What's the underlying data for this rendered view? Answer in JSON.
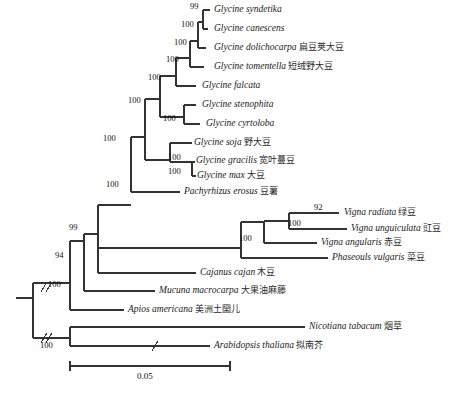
{
  "figure": {
    "kind": "phylogenetic-tree",
    "background_color": "#ffffff",
    "line_color": "#333333",
    "scale_bar": {
      "label": "0.05",
      "x_start": 70,
      "x_end": 230,
      "y": 366
    }
  },
  "taxa": [
    {
      "id": "glycine_syndetika",
      "latin": "Glycine syndetika",
      "chinese": "",
      "y": 10,
      "branch_x": 210,
      "label_x": 214
    },
    {
      "id": "glycine_canescens",
      "latin": "Glycine canescens",
      "chinese": "",
      "y": 29,
      "branch_x": 208,
      "label_x": 214
    },
    {
      "id": "glycine_dolichocarpa",
      "latin": "Glycine dolichocarpa",
      "chinese": "扁豆荚大豆",
      "y": 48,
      "branch_x": 206,
      "label_x": 214
    },
    {
      "id": "glycine_tomentella",
      "latin": "Glycine tomentella",
      "chinese": "短绒野大豆",
      "y": 67,
      "branch_x": 204,
      "label_x": 214
    },
    {
      "id": "glycine_falcata",
      "latin": "Glycine falcata",
      "chinese": "",
      "y": 86,
      "branch_x": 196,
      "label_x": 202
    },
    {
      "id": "glycine_stenophita",
      "latin": "Glycine stenophita",
      "chinese": "",
      "y": 105,
      "branch_x": 196,
      "label_x": 202
    },
    {
      "id": "glycine_cyrtoloba",
      "latin": "Glycine cyrtoloba",
      "chinese": "",
      "y": 124,
      "branch_x": 200,
      "label_x": 206
    },
    {
      "id": "glycine_soja",
      "latin": "Glycine soja",
      "chinese": "野大豆",
      "y": 143,
      "branch_x": 192,
      "label_x": 194
    },
    {
      "id": "glycine_gracilis",
      "latin": "Glycine gracilis",
      "chinese": "宽叶蔓豆",
      "y": 162,
      "branch_x": 195,
      "label_x": 196
    },
    {
      "id": "glycine_max",
      "latin": "Glycine max",
      "chinese": "大豆",
      "y": 176,
      "branch_x": 196,
      "label_x": 197
    },
    {
      "id": "pachyrhizus_erosus",
      "latin": "Pachyrhizus erosus",
      "chinese": "豆薯",
      "y": 192,
      "branch_x": 180,
      "label_x": 184
    },
    {
      "id": "vigna_radiata",
      "latin": "Vigna radiata",
      "chinese": "绿豆",
      "y": 213,
      "branch_x": 339,
      "label_x": 344
    },
    {
      "id": "vigna_unguiculata",
      "latin": "Vigna unguiculata",
      "chinese": "豇豆",
      "y": 229,
      "branch_x": 347,
      "label_x": 351
    },
    {
      "id": "vigna_angularis",
      "latin": "Vigna angularis",
      "chinese": "赤豆",
      "y": 243,
      "branch_x": 317,
      "label_x": 321
    },
    {
      "id": "phaseoulus_vulgaris",
      "latin": "Phaseouls vulgaris",
      "chinese": "菜豆",
      "y": 258,
      "branch_x": 328,
      "label_x": 332
    },
    {
      "id": "cajanus_cajan",
      "latin": "Cajanus cajan",
      "chinese": "木豆",
      "y": 273,
      "branch_x": 196,
      "label_x": 200
    },
    {
      "id": "mucuna_macrocarpa",
      "latin": "Mucuna macrocarpa",
      "chinese": "大果油麻藤",
      "y": 291,
      "branch_x": 155,
      "label_x": 159
    },
    {
      "id": "apios_americana",
      "latin": "Apios americana",
      "chinese": "美洲土圞儿",
      "y": 310,
      "branch_x": 124,
      "label_x": 128
    },
    {
      "id": "nicotiana_tabacum",
      "latin": "Nicotiana tabacum",
      "chinese": "烟草",
      "y": 327,
      "branch_x": 305,
      "label_x": 309
    },
    {
      "id": "arabidopsis_thaliana",
      "latin": "Arabidopsis thaliana",
      "chinese": "拟南芥",
      "y": 346,
      "branch_x": 210,
      "label_x": 214
    }
  ],
  "bootstrap_values": [
    {
      "id": "bs-syndetika-canescens",
      "value": "99",
      "x": 190,
      "y": 4
    },
    {
      "id": "bs-node-canescens",
      "value": "100",
      "x": 184,
      "y": 23
    },
    {
      "id": "bs-node-dolichocarpa",
      "value": "100",
      "x": 178,
      "y": 41
    },
    {
      "id": "bs-node-tomentella",
      "value": "100",
      "x": 170,
      "y": 58
    },
    {
      "id": "bs-node-falcata",
      "value": "100",
      "x": 150,
      "y": 76
    },
    {
      "id": "bs-node-cyrtoloba",
      "value": "100",
      "x": 167,
      "y": 117
    },
    {
      "id": "bs-node-glycine-core",
      "value": "100",
      "x": 131,
      "y": 99
    },
    {
      "id": "bs-node-gracilis",
      "value": "100",
      "x": 171,
      "y": 156
    },
    {
      "id": "bs-node-max",
      "value": "100",
      "x": 171,
      "y": 170
    },
    {
      "id": "bs-node-glycine-all",
      "value": "100",
      "x": 105,
      "y": 137
    },
    {
      "id": "bs-node-pachyrhizus",
      "value": "100",
      "x": 108,
      "y": 183
    },
    {
      "id": "bs-node-vigna-rad-ung",
      "value": "92",
      "x": 316,
      "y": 206
    },
    {
      "id": "bs-node-vigna",
      "value": "100",
      "x": 290,
      "y": 222
    },
    {
      "id": "bs-node-phaseoleae",
      "value": "100",
      "x": 241,
      "y": 237
    },
    {
      "id": "bs-node-99",
      "value": "99",
      "x": 70,
      "y": 226
    },
    {
      "id": "bs-node-94",
      "value": "94",
      "x": 56,
      "y": 254
    },
    {
      "id": "bs-node-legume-root",
      "value": "100",
      "x": 49,
      "y": 283
    },
    {
      "id": "bs-node-outgroup",
      "value": "100",
      "x": 41,
      "y": 344
    }
  ],
  "break_marks": [
    {
      "id": "break-legume-stem",
      "x": 44,
      "y": 288
    },
    {
      "id": "break-outgroup-stem",
      "x": 44,
      "y": 333
    },
    {
      "id": "break-arabidopsis",
      "x": 155,
      "y": 346
    }
  ]
}
